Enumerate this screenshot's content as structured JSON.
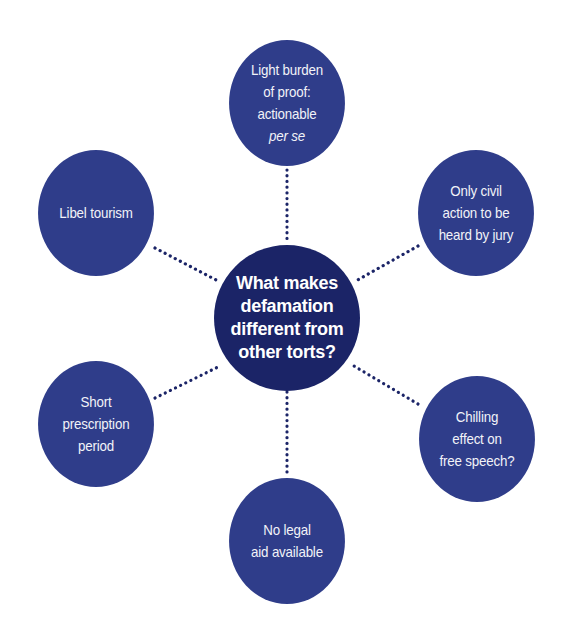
{
  "diagram": {
    "type": "hub-and-spoke",
    "colors": {
      "outer_node": "#2f3d8a",
      "center_node": "#1b2467",
      "connector": "#1b2467",
      "text": "#ffffff",
      "background": "#ffffff"
    },
    "center": {
      "label": "What makes\ndefamation\ndifferent from\nother torts?"
    },
    "nodes": [
      {
        "id": "top",
        "label": "Light burden\nof proof:\nactionable",
        "label_italic": "per se"
      },
      {
        "id": "top-left",
        "label": "Libel tourism"
      },
      {
        "id": "top-right",
        "label": "Only civil\naction to be\nheard by jury"
      },
      {
        "id": "bottom-left",
        "label": "Short\nprescription\nperiod"
      },
      {
        "id": "bottom-right",
        "label": "Chilling\neffect on\nfree speech?"
      },
      {
        "id": "bottom",
        "label": "No legal\naid available"
      }
    ]
  }
}
